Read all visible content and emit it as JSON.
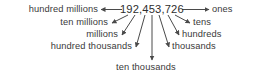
{
  "diagram": {
    "type": "place-value-chart",
    "number": "192,453,726",
    "labels": {
      "hundred_millions": "hundred millions",
      "ten_millions": "ten millions",
      "millions": "millions",
      "hundred_thousands": "hundred thousands",
      "ten_thousands": "ten thousands",
      "thousands": "thousands",
      "hundreds": "hundreds",
      "tens": "tens",
      "ones": "ones"
    },
    "colors": {
      "text": "#3a3a3a",
      "number": "#2e2e2e",
      "line": "#4a4a4a",
      "background": "#ffffff"
    }
  }
}
